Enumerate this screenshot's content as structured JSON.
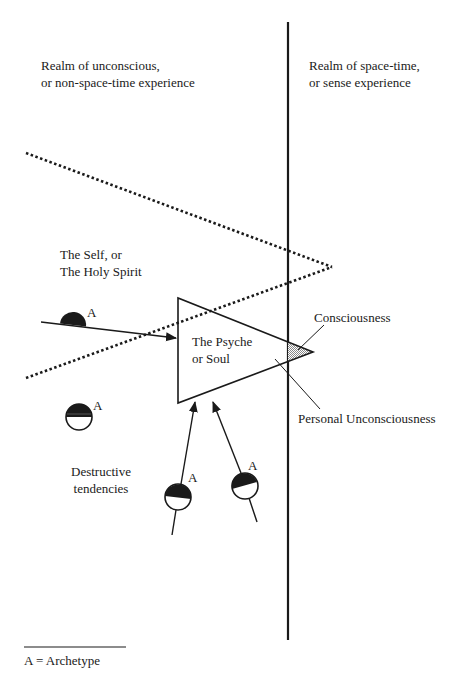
{
  "figure": {
    "left_region": {
      "line1": "Realm of unconscious,",
      "line2": "or non-space-time experience"
    },
    "right_region": {
      "line1": "Realm of space-time,",
      "line2": "or sense experience"
    },
    "self_label": {
      "line1": "The Self, or",
      "line2": "The Holy Spirit"
    },
    "psyche_label": {
      "line1": "The Psyche",
      "line2": "or Soul"
    },
    "consciousness_label": "Consciousness",
    "personal_unconscious_label": "Personal Unconsciousness",
    "destructive_label": {
      "line1": "Destructive",
      "line2": "tendencies"
    },
    "archetype_marker": "A",
    "legend": "A = Archetype"
  },
  "colors": {
    "ink": "#1a1a1a",
    "background": "#ffffff",
    "shade": "#b8b8b8"
  }
}
